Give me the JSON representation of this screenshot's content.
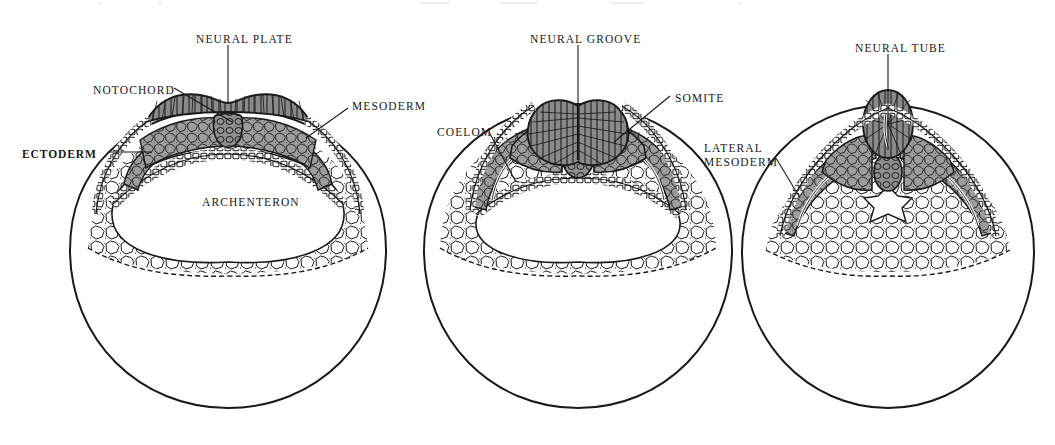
{
  "figure": {
    "background": "#ffffff",
    "width": 1055,
    "height": 445,
    "ink_color": "#1a1a1a",
    "tissue_fill_gray": "#9a9a9a",
    "neural_fill_gray": "#8d8d8d",
    "yolk_fill": "#ffffff"
  },
  "panels": [
    {
      "id": "stage-1",
      "name": "neural-plate-stage",
      "labels": [
        {
          "key": "neural_plate",
          "text": "NEURAL PLATE",
          "x": 196,
          "y": 33,
          "bold": false,
          "lines": 1
        },
        {
          "key": "notochord",
          "text": "NOTOCHORD",
          "x": 93,
          "y": 84,
          "bold": false,
          "lines": 1
        },
        {
          "key": "ectoderm",
          "text": "ECTODERM",
          "x": 22,
          "y": 148,
          "bold": true,
          "lines": 1
        },
        {
          "key": "mesoderm",
          "text": "MESODERM",
          "x": 352,
          "y": 100,
          "bold": false,
          "lines": 1
        },
        {
          "key": "archenteron",
          "text": "ARCHENTERON",
          "x": 202,
          "y": 196,
          "bold": false,
          "lines": 1
        }
      ]
    },
    {
      "id": "stage-2",
      "name": "neural-groove-stage",
      "labels": [
        {
          "key": "neural_groove",
          "text": "NEURAL GROOVE",
          "x": 530,
          "y": 33,
          "bold": false,
          "lines": 1
        },
        {
          "key": "coelom",
          "text": "COELOM",
          "x": 437,
          "y": 126,
          "bold": false,
          "lines": 1
        },
        {
          "key": "somite",
          "text": "SOMITE",
          "x": 675,
          "y": 92,
          "bold": false,
          "lines": 1
        }
      ]
    },
    {
      "id": "stage-3",
      "name": "neural-tube-stage",
      "labels": [
        {
          "key": "neural_tube",
          "text": "NEURAL TUBE",
          "x": 855,
          "y": 42,
          "bold": false,
          "lines": 1
        },
        {
          "key": "lateral_mesoderm",
          "text": "LATERAL\nMESODERM",
          "x": 704,
          "y": 141,
          "bold": false,
          "lines": 2
        }
      ]
    }
  ]
}
